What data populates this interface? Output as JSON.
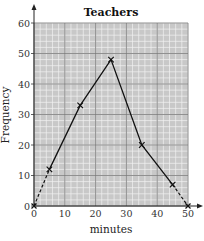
{
  "chart_data": {
    "type": "line",
    "title": "Teachers",
    "xlabel": "minutes",
    "ylabel": "Frequency",
    "xlim": [
      0,
      50
    ],
    "ylim": [
      0,
      60
    ],
    "x_ticks": [
      0,
      10,
      20,
      30,
      40,
      50
    ],
    "y_ticks": [
      0,
      10,
      20,
      30,
      40,
      50,
      60
    ],
    "grid": true,
    "series": [
      {
        "name": "Teachers",
        "style": "solid",
        "marker": "x",
        "x": [
          5,
          15,
          25,
          35,
          45
        ],
        "y": [
          12,
          33,
          48,
          20,
          7
        ]
      }
    ],
    "dashed_extensions": [
      {
        "from": [
          0,
          0
        ],
        "to": [
          5,
          12
        ]
      },
      {
        "from": [
          45,
          7
        ],
        "to": [
          50,
          0
        ]
      }
    ]
  },
  "colors": {
    "plot_background": "#c8c8c8",
    "minor_grid": "#f2f2f2",
    "major_grid": "#7a7a7a",
    "line": "#111111"
  }
}
